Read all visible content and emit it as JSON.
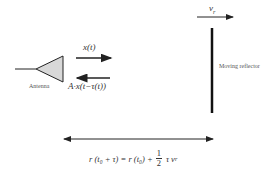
{
  "diagram": {
    "antenna": {
      "label": "Antenna"
    },
    "reflector": {
      "label": "Moving reflector",
      "velocity_label": "v",
      "velocity_subscript": "r"
    },
    "signals": {
      "transmitted": "x(t)",
      "received": "A·x(t−τ(t))"
    },
    "range_equation": {
      "lhs": "r (t₀ + τ) = r (t₀) +",
      "frac_num": "1",
      "frac_den": "2",
      "rhs_tau": "τ v",
      "rhs_sub": "r"
    },
    "colors": {
      "stroke": "#222222",
      "antenna_fill": "#d8d8d8"
    }
  }
}
